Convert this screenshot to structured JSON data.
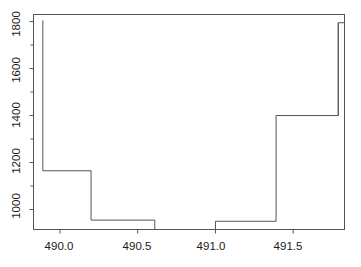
{
  "chart_data": {
    "type": "line",
    "subtype": "step",
    "title": "",
    "xlabel": "",
    "ylabel": "",
    "xlim": [
      489.83,
      491.83
    ],
    "ylim": [
      915,
      1830
    ],
    "grid": false,
    "legend": null,
    "line_color": "#555555",
    "background": "#ffffff",
    "axis_color": "#555555",
    "xticks": [
      490.0,
      490.5,
      491.0,
      491.5
    ],
    "xtick_labels": [
      "490.0",
      "490.5",
      "491.0",
      "491.5"
    ],
    "yticks": [
      1000,
      1200,
      1400,
      1600,
      1800
    ],
    "ytick_labels": [
      "1000",
      "1200",
      "1400",
      "1600",
      "1800"
    ],
    "yticks_minor": [
      1100,
      1300,
      1500,
      1700
    ],
    "x": [
      489.89,
      490.2,
      490.61,
      491.0,
      491.39,
      491.79
    ],
    "step_levels": [
      1165,
      955,
      915,
      950,
      1400,
      1795
    ],
    "segments": [
      {
        "x_start": 489.89,
        "x_end": 490.2,
        "y": 1165
      },
      {
        "x_start": 490.2,
        "x_end": 490.61,
        "y": 955
      },
      {
        "x_start": 490.61,
        "x_end": 491.0,
        "y": 915
      },
      {
        "x_start": 491.0,
        "x_end": 491.39,
        "y": 950
      },
      {
        "x_start": 491.39,
        "x_end": 491.79,
        "y": 1400
      },
      {
        "x_start": 491.79,
        "x_end": 491.83,
        "y": 1795
      }
    ],
    "spikes": [
      {
        "x": 489.89,
        "y_from": 1165,
        "y_to": 1805
      },
      {
        "x": 491.79,
        "y_from": 1400,
        "y_to": 1795
      }
    ]
  },
  "axes": {
    "x_tick_labels": [
      "490.0",
      "490.5",
      "491.0",
      "491.5"
    ],
    "y_tick_labels": [
      "1000",
      "1200",
      "1400",
      "1600",
      "1800"
    ]
  }
}
